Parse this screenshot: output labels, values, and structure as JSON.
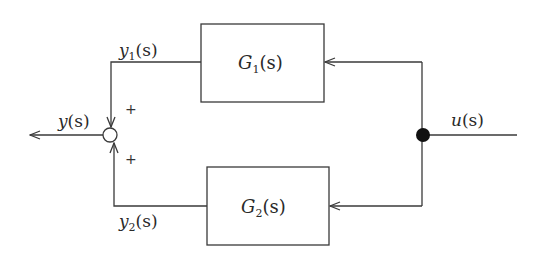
{
  "diagram": {
    "type": "block-diagram",
    "input": {
      "label": "u",
      "arg": "(s)"
    },
    "output": {
      "label": "y",
      "arg": "(s)"
    },
    "blocks": [
      {
        "id": "G1",
        "label": "G",
        "sub": "1",
        "arg": "(s)"
      },
      {
        "id": "G2",
        "label": "G",
        "sub": "2",
        "arg": "(s)"
      }
    ],
    "signals": [
      {
        "id": "y1",
        "label": "y",
        "sub": "1",
        "arg": "(s)"
      },
      {
        "id": "y2",
        "label": "y",
        "sub": "2",
        "arg": "(s)"
      }
    ],
    "summing_junction": {
      "signs": [
        "+",
        "+"
      ]
    },
    "branch_point": "filled-dot",
    "colors": {
      "line": "#3a3a3a",
      "text": "#2a2a2a",
      "background": "#ffffff"
    }
  }
}
